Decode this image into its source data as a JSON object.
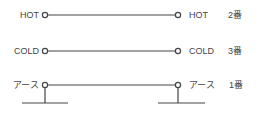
{
  "diagram": {
    "rows": [
      {
        "left_label": "HOT",
        "right_label": "HOT",
        "pin": "2番"
      },
      {
        "left_label": "COLD",
        "right_label": "COLD",
        "pin": "3番"
      },
      {
        "left_label": "アース",
        "right_label": "アース",
        "pin": "1番"
      }
    ],
    "colors": {
      "line": "#444444",
      "text": "#444444",
      "background": "#ffffff"
    }
  }
}
